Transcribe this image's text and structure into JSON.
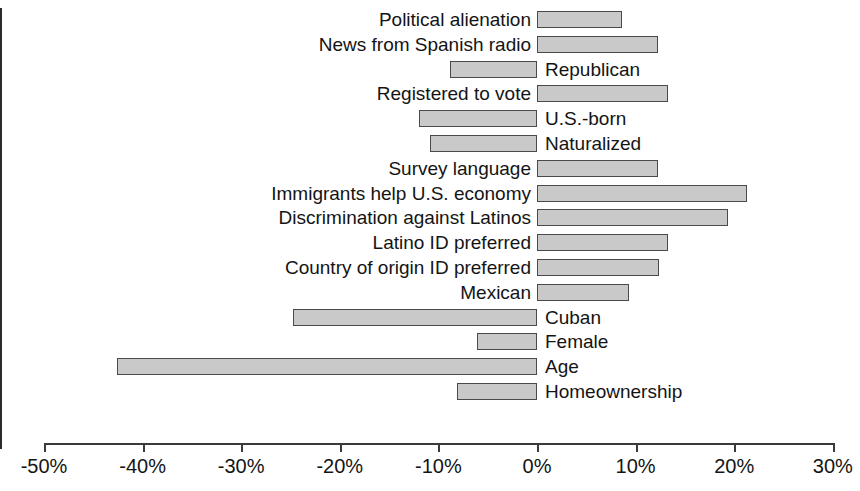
{
  "chart_data": {
    "type": "bar",
    "orientation": "horizontal",
    "title": "",
    "subtitle": "",
    "xlabel": "",
    "ylabel": "",
    "xlim": [
      -50,
      30
    ],
    "grid": false,
    "legend": null,
    "value_unit": "percent",
    "xtick_labels": [
      "-50%",
      "-40%",
      "-30%",
      "-20%",
      "-10%",
      "0%",
      "10%",
      "20%",
      "30%"
    ],
    "xtick_values": [
      -50,
      -40,
      -30,
      -20,
      -10,
      0,
      10,
      20,
      30
    ],
    "categories": [
      "Political alienation",
      "News from Spanish radio",
      "Republican",
      "Registered to vote",
      "U.S.-born",
      "Naturalized",
      "Survey language",
      "Immigrants help U.S. economy",
      "Discrimination against Latinos",
      "Latino ID preferred",
      "Country of origin ID preferred",
      "Mexican",
      "Cuban",
      "Female",
      "Age",
      "Homeownership"
    ],
    "values": [
      8.6,
      12.3,
      -8.8,
      13.3,
      -12.0,
      -10.9,
      12.3,
      21.3,
      19.4,
      13.3,
      12.4,
      9.3,
      -24.7,
      -6.1,
      -42.6,
      -8.1
    ],
    "bar_fill_color": "#c9c9c9",
    "bar_edge_color": "#4a4a4a",
    "axis_color": "#3a3a3a"
  }
}
